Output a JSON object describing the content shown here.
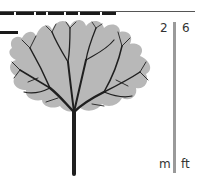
{
  "header": {
    "title_cropped": true
  },
  "figure": {
    "canopy_color": "#b8b8b8",
    "branch_color": "#1f1f1f"
  },
  "scale": {
    "metric_value": "2",
    "imperial_value": "6",
    "metric_unit": "m",
    "imperial_unit": "ft",
    "bar_color": "#9a9a9a"
  }
}
